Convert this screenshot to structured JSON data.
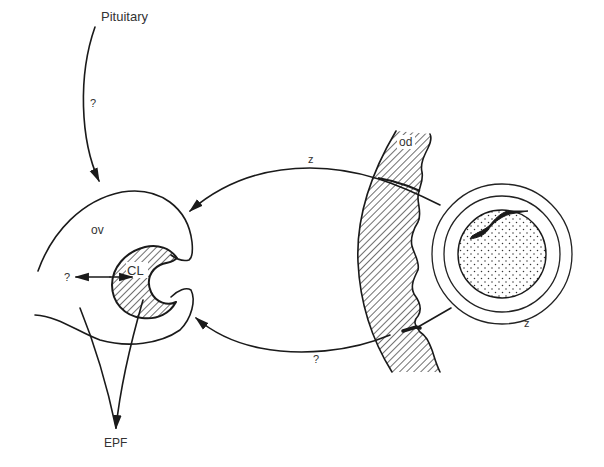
{
  "figure": {
    "colors": {
      "ink": "#1a1a1a",
      "label": "#333333",
      "background": "#ffffff"
    },
    "labels": {
      "pituitary": "Pituitary",
      "pituitary_arrow_query": "?",
      "ovary": "ov",
      "corpus_luteum": "CL",
      "cl_query": "?",
      "oviduct": "od",
      "top_arc": "z",
      "bottom_arc": "?",
      "embryo_link": "z",
      "output": "EPF"
    },
    "nodes": [
      {
        "id": "pituitary",
        "label": "Pituitary"
      },
      {
        "id": "ovary",
        "label": "ov"
      },
      {
        "id": "corpus_luteum",
        "label": "CL"
      },
      {
        "id": "oviduct",
        "label": "od"
      },
      {
        "id": "embryo",
        "label": ""
      },
      {
        "id": "epf",
        "label": "EPF"
      }
    ],
    "edges": [
      {
        "from": "pituitary",
        "to": "ovary",
        "label": "?"
      },
      {
        "from": "embryo",
        "to": "ovary",
        "label": "z",
        "via": "oviduct (upper)"
      },
      {
        "from": "embryo",
        "to": "ovary",
        "label": "?",
        "via": "oviduct (lower)",
        "extra_label": "z"
      },
      {
        "from": "corpus_luteum",
        "to": "unknown",
        "label": "?"
      },
      {
        "from": "ovary",
        "to": "epf",
        "label": ""
      },
      {
        "from": "corpus_luteum",
        "to": "epf",
        "label": ""
      }
    ]
  }
}
